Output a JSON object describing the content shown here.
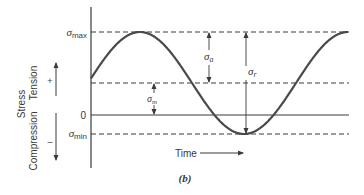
{
  "figure": {
    "caption": "(b)",
    "y_axis": {
      "label": "Stress",
      "tension_label": "Tension",
      "tension_sign": "+",
      "compression_label": "Compression",
      "compression_sign": "–"
    },
    "x_axis": {
      "label": "Time"
    },
    "levels": {
      "max": {
        "symbol": "σ",
        "sub": "max",
        "y": 32
      },
      "mean": {
        "y": 83
      },
      "zero": {
        "label": "0",
        "y": 115
      },
      "min": {
        "symbol": "σ",
        "sub": "min",
        "y": 134
      }
    },
    "annotations": {
      "amplitude": {
        "symbol": "σ",
        "sub": "a"
      },
      "range": {
        "symbol": "σ",
        "sub": "r"
      },
      "mean": {
        "symbol": "σ",
        "sub": "m"
      }
    },
    "curve": {
      "type": "sinusoid",
      "x_start": 91,
      "x_end": 348,
      "phase_zero_x": 88,
      "period_px": 208,
      "mean_y": 83,
      "amplitude_px": 51
    }
  }
}
